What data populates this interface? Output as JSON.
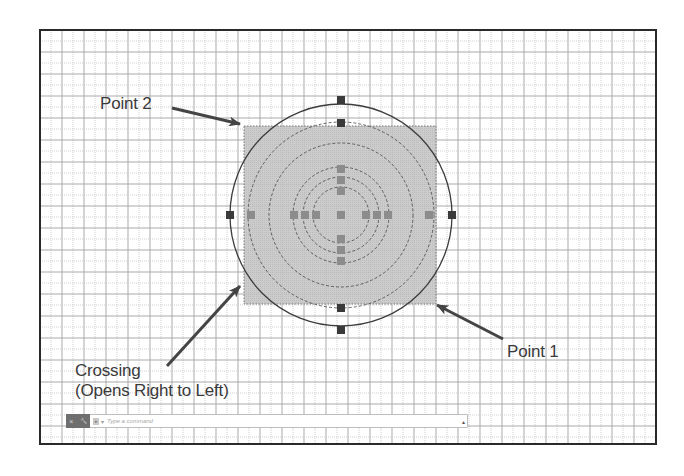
{
  "viewport": {
    "frame": {
      "x": 40,
      "y": 30,
      "width": 616,
      "height": 414,
      "border_color": "#2a2a2a"
    },
    "grid": {
      "major_spacing": 22,
      "origin_x": 40,
      "origin_y": 30,
      "major_color": "#a9a9a9",
      "minor_color": "#cfcfcf"
    }
  },
  "drawing": {
    "center": {
      "x": 341,
      "y": 215
    },
    "circles": [
      {
        "name": "outer-solid",
        "r": 111,
        "style": "solid"
      },
      {
        "name": "dashed-large",
        "r": 93,
        "style": "dashed"
      },
      {
        "name": "dashed-medium",
        "r": 72,
        "style": "dashed"
      },
      {
        "name": "dashed-inner-1",
        "r": 48,
        "style": "dashed"
      },
      {
        "name": "dashed-inner-2",
        "r": 38,
        "style": "dashed"
      },
      {
        "name": "dashed-inner-3",
        "r": 28,
        "style": "dashed"
      }
    ],
    "selection_window": {
      "type": "crossing",
      "x1": 244,
      "y1": 126,
      "x2": 436,
      "y2": 304,
      "fill": "#c4c4c4",
      "border": "#7a7a7a"
    },
    "grips_dark": [
      [
        341,
        100
      ],
      [
        341,
        123
      ],
      [
        341,
        308
      ],
      [
        341,
        330
      ],
      [
        230,
        215
      ],
      [
        452,
        215
      ]
    ],
    "grips_gray": [
      [
        251,
        215
      ],
      [
        294,
        215
      ],
      [
        305,
        215
      ],
      [
        316,
        215
      ],
      [
        341,
        215
      ],
      [
        366,
        215
      ],
      [
        377,
        215
      ],
      [
        388,
        215
      ],
      [
        429,
        215
      ],
      [
        341,
        169
      ],
      [
        341,
        180
      ],
      [
        341,
        191
      ],
      [
        341,
        239
      ],
      [
        341,
        250
      ],
      [
        341,
        261
      ]
    ],
    "colors": {
      "grip_dark": "#3a3a3a",
      "grip_gray": "#8c8c8c",
      "line": "#3c3c3c"
    }
  },
  "annotations": {
    "point2": {
      "label": "Point 2",
      "x": 100,
      "y": 94,
      "arrow_from": [
        172,
        108
      ],
      "arrow_to": [
        240,
        124
      ]
    },
    "point1": {
      "label": "Point 1",
      "x": 507,
      "y": 342,
      "arrow_from": [
        503,
        339
      ],
      "arrow_to": [
        437,
        305
      ]
    },
    "crossing": {
      "line1": "Crossing",
      "line2": "(Opens Right to Left)",
      "x": 75,
      "y": 361,
      "arrow_from": [
        167,
        366
      ],
      "arrow_to": [
        240,
        286
      ]
    },
    "arrow_color": "#444444"
  },
  "command_line": {
    "close_icon": "×",
    "settings_icon": "🔧",
    "prompt_icon": "▸",
    "placeholder": "Type a command",
    "value": "",
    "dropdown_icon": "▴"
  }
}
